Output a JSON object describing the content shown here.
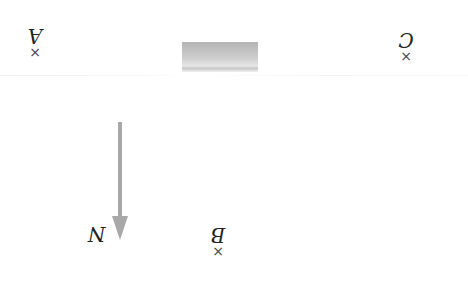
{
  "diagram": {
    "orientation": "rotated 180 degrees",
    "points": [
      {
        "id": "A",
        "label": "A",
        "marker": "×"
      },
      {
        "id": "B",
        "label": "B",
        "marker": "×"
      },
      {
        "id": "C",
        "label": "C",
        "marker": "×"
      }
    ],
    "north_arrow": {
      "label": "N",
      "color": "#a8a8a8"
    },
    "obstacle": {
      "shape": "gray rectangle"
    }
  }
}
